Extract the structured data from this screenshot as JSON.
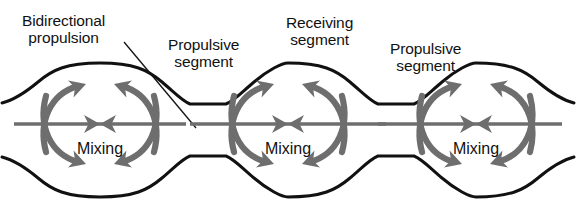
{
  "figure": {
    "type": "schematic-diagram",
    "background_color": "#ffffff",
    "outline_color": "#111111",
    "arrow_color": "#6e6e6e",
    "text_color": "#111111"
  },
  "labels": {
    "bidirectional": "Bidirectional\npropulsion",
    "propulsive_left": "Propulsive\nsegment",
    "receiving": "Receiving\nsegment",
    "propulsive_right": "Propulsive\nsegment"
  },
  "chambers": [
    {
      "id": "chamber-left",
      "label": "Mixing",
      "cx": 100,
      "cy": 124
    },
    {
      "id": "chamber-middle",
      "label": "Mixing",
      "cx": 288,
      "cy": 124
    },
    {
      "id": "chamber-right",
      "label": "Mixing",
      "cx": 476,
      "cy": 124
    }
  ],
  "flow": {
    "axial_arrow_directions": [
      "right",
      "left"
    ],
    "circulation_arrow_count_per_chamber": 4,
    "description": "Opposed axial arrows converge at each chamber centre; four curved arrows sweep inward over the top and bottom walls."
  }
}
